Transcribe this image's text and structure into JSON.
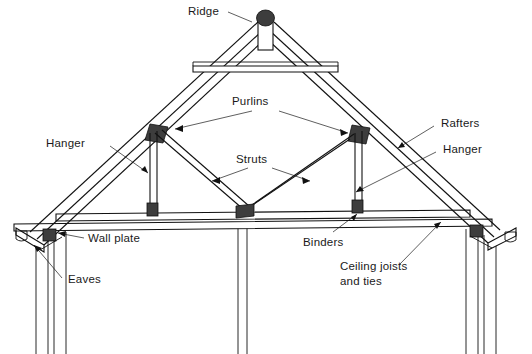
{
  "figure": {
    "background_color": "#ffffff",
    "line_color": "#111111",
    "block_color": "#3d3d3d",
    "width": 532,
    "height": 354
  },
  "labels": {
    "ridge": "Ridge",
    "purlins": "Purlins",
    "rafters": "Rafters",
    "struts": "Struts",
    "hanger_left": "Hanger",
    "hanger_right": "Hanger",
    "wall_plate": "Wall plate",
    "eaves": "Eaves",
    "binders": "Binders",
    "ceiling_joists_line1": "Ceiling joists",
    "ceiling_joists_line2": "and ties"
  },
  "components": [
    {
      "name": "ridge",
      "description": "Ridge board with rounded cap at apex"
    },
    {
      "name": "rafters",
      "description": "Sloping double-line rafters both sides"
    },
    {
      "name": "purlins",
      "description": "Dark blocks on rafter underside mid-slope"
    },
    {
      "name": "struts",
      "description": "Diagonal braces from centre to purlins"
    },
    {
      "name": "hangers",
      "description": "Vertical posts from rafter to binder"
    },
    {
      "name": "binders",
      "description": "Upper horizontal beam across truss"
    },
    {
      "name": "ceiling-joists-and-ties",
      "description": "Lower horizontal beam"
    },
    {
      "name": "wall-plate",
      "description": "Dark block on top of wall at eaves"
    },
    {
      "name": "eaves",
      "description": "Overhanging rafter foot with gutter"
    },
    {
      "name": "collar-tie",
      "description": "Horizontal tie near ridge"
    },
    {
      "name": "walls",
      "description": "Vertical cavity walls left, right and centre partition"
    }
  ]
}
